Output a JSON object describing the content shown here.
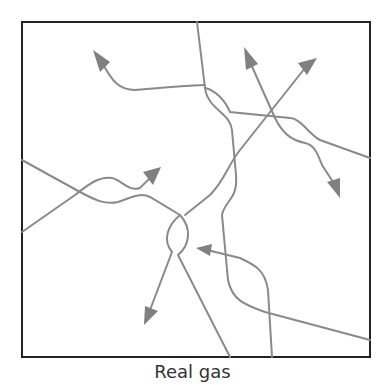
{
  "diagram": {
    "caption": "Real gas",
    "colors": {
      "border": "#222222",
      "path": "#8a8a8a",
      "arrowhead": "#808080",
      "background": "#ffffff"
    },
    "box": {
      "x": 22,
      "y": 22,
      "width": 348,
      "height": 335
    },
    "paths": [
      {
        "id": "path-top-left",
        "label": "molecule trajectory ending in up-left arrow"
      },
      {
        "id": "path-top-vertical",
        "label": "molecule trajectory from top edge to bottom-right"
      },
      {
        "id": "path-up-down",
        "label": "molecule trajectory with up and down arrows"
      },
      {
        "id": "path-left-lower",
        "label": "molecule trajectory from left edge to up-right arrow"
      },
      {
        "id": "path-left-upper",
        "label": "molecule trajectory from left edge to bottom"
      },
      {
        "id": "path-diag-up-right",
        "label": "molecule trajectory ending in up-right arrow"
      },
      {
        "id": "path-down-left",
        "label": "molecule trajectory ending in down-left arrow"
      },
      {
        "id": "path-bottom-left-arrow",
        "label": "molecule trajectory ending in left arrow"
      }
    ]
  }
}
